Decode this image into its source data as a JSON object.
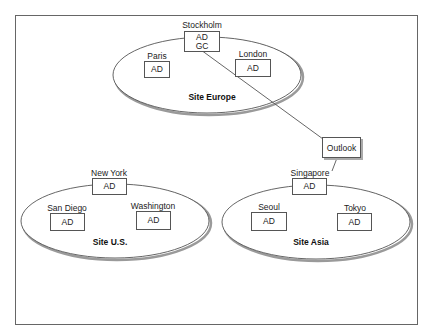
{
  "diagram": {
    "frame": {
      "x": 15,
      "y": 15,
      "w": 402,
      "h": 309
    },
    "sites": [
      {
        "name": "Site Europe",
        "cx": 207,
        "cy": 75,
        "rx": 94,
        "ry": 38,
        "label_x": 212,
        "label_y": 92
      },
      {
        "name": "Site U.S.",
        "cx": 115,
        "cy": 221,
        "rx": 94,
        "ry": 37,
        "label_x": 110,
        "label_y": 238
      },
      {
        "name": "Site Asia",
        "cx": 316,
        "cy": 222,
        "rx": 94,
        "ry": 37,
        "label_x": 311,
        "label_y": 238
      }
    ],
    "locations": {
      "stockholm": {
        "name": "Stockholm",
        "roles": [
          "AD",
          "GC"
        ]
      },
      "paris": {
        "name": "Paris",
        "roles": [
          "AD"
        ]
      },
      "london": {
        "name": "London",
        "roles": [
          "AD"
        ]
      },
      "new_york": {
        "name": "New York",
        "roles": [
          "AD"
        ]
      },
      "san_diego": {
        "name": "San Diego",
        "roles": [
          "AD"
        ]
      },
      "washington": {
        "name": "Washington",
        "roles": [
          "AD"
        ]
      },
      "singapore": {
        "name": "Singapore",
        "roles": [
          "AD"
        ]
      },
      "seoul": {
        "name": "Seoul",
        "roles": [
          "AD"
        ]
      },
      "tokyo": {
        "name": "Tokyo",
        "roles": [
          "AD"
        ]
      }
    },
    "outlook": {
      "label": "Outlook"
    },
    "links": [
      {
        "from": "Stockholm",
        "to": "Outlook"
      },
      {
        "from": "Outlook",
        "to": "Singapore"
      }
    ],
    "colors": {
      "stroke": "#555555",
      "shadow": "#9a9a9a",
      "text": "#222222"
    }
  }
}
